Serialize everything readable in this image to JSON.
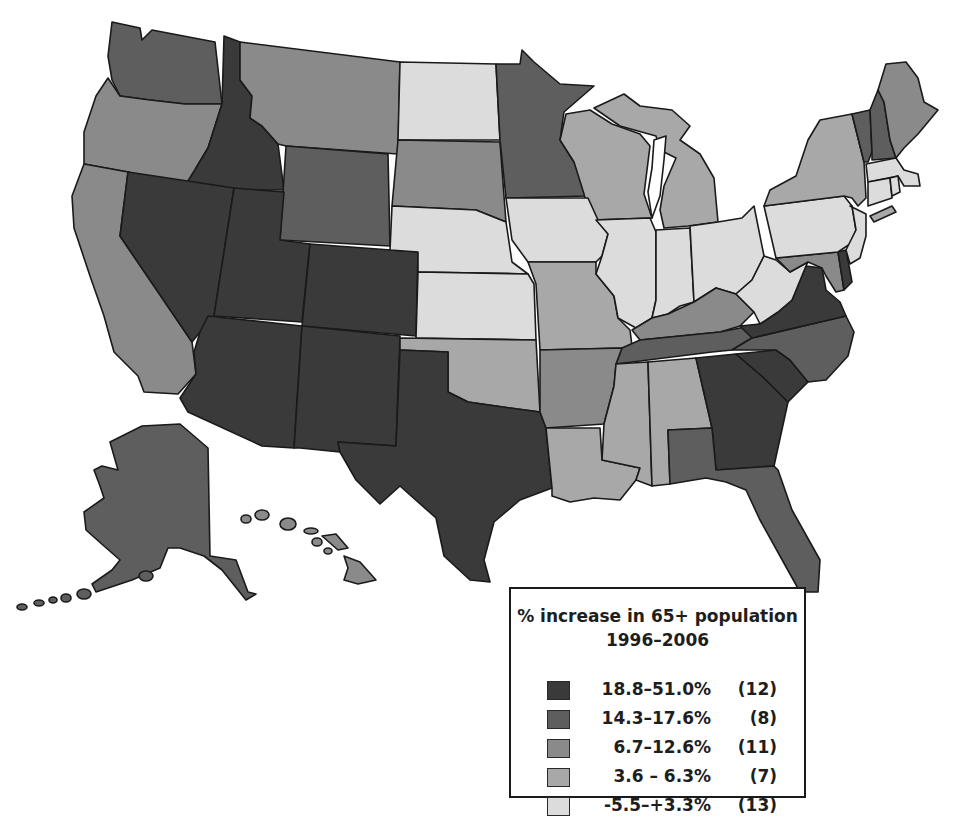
{
  "legend": {
    "title_line1": "% increase in 65+ population",
    "title_line2": "1996–2006",
    "classes": [
      {
        "range": "18.8–51.0%",
        "count": "(12)",
        "color": "#3a3a3a"
      },
      {
        "range": "14.3–17.6%",
        "count": "(8)",
        "color": "#5e5e5e"
      },
      {
        "range": "6.7–12.6%",
        "count": "(11)",
        "color": "#8a8a8a"
      },
      {
        "range": "3.6 – 6.3%",
        "count": "(7)",
        "color": "#a8a8a8"
      },
      {
        "range": "-5.5–+3.3%",
        "count": "(13)",
        "color": "#dcdcdc"
      }
    ]
  },
  "map_data": {
    "type": "choropleth",
    "title": "% increase in 65+ population 1996–2006",
    "region": "United States",
    "state_classes": {
      "18.8–51.0%": [
        "ID",
        "NV",
        "UT",
        "AZ",
        "CO",
        "NM",
        "TX",
        "GA",
        "SC",
        "VA",
        "DE"
      ],
      "14.3–17.6%": [
        "WA",
        "WY",
        "MN",
        "VT",
        "NH",
        "NC",
        "TN",
        "FL",
        "AK"
      ],
      "6.7–12.6%": [
        "OR",
        "CA",
        "MT",
        "SD",
        "AR",
        "KY",
        "MD",
        "ME",
        "HI"
      ],
      "3.6 – 6.3%": [
        "WI",
        "MI",
        "MO",
        "OK",
        "LA",
        "MS",
        "AL",
        "NY"
      ],
      "-5.5–+3.3%": [
        "ND",
        "NE",
        "KS",
        "IA",
        "IL",
        "IN",
        "OH",
        "WV",
        "PA",
        "NJ",
        "MA",
        "CT",
        "RI"
      ]
    }
  }
}
